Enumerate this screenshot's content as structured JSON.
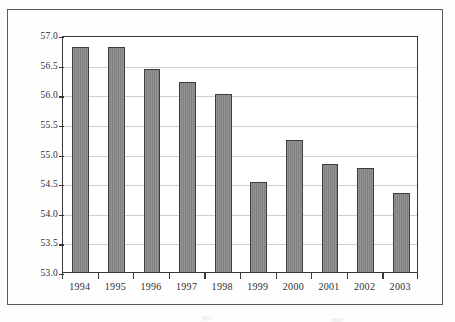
{
  "chart_data": {
    "type": "bar",
    "title": "",
    "subtitle": "",
    "xlabel": "",
    "ylabel": "",
    "categories": [
      "1994",
      "1995",
      "1996",
      "1997",
      "1998",
      "1999",
      "2000",
      "2001",
      "2002",
      "2003"
    ],
    "values": [
      56.8,
      56.8,
      56.42,
      56.2,
      56.0,
      54.52,
      55.22,
      54.83,
      54.75,
      54.33
    ],
    "series": [
      {
        "name": "",
        "values": [
          56.8,
          56.8,
          56.42,
          56.2,
          56.0,
          54.52,
          55.22,
          54.83,
          54.75,
          54.33
        ]
      }
    ],
    "ylim": [
      53.0,
      57.0
    ],
    "ytick_labels": [
      "57.0",
      "56.5",
      "56.0",
      "55.5",
      "55.0",
      "54.5",
      "54.0",
      "53.5",
      "53.0"
    ],
    "ytick_values": [
      57.0,
      56.5,
      56.0,
      55.5,
      55.0,
      54.5,
      54.0,
      53.5,
      53.0
    ],
    "grid": true,
    "legend": "none",
    "bar_color": "#87878a",
    "bar_edge_color": "#3c3b3f",
    "gridline_color": "#cfcfcf",
    "axis_color": "#37363a",
    "annotations": []
  }
}
